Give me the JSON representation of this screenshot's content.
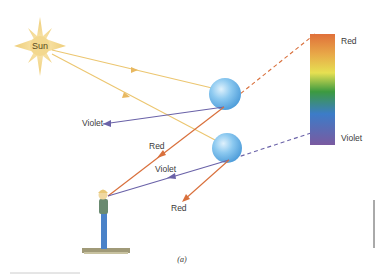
{
  "figure": {
    "caption": "(a)",
    "sun_label": "Sun",
    "spectrum": {
      "top_label": "Red",
      "bottom_label": "Violet",
      "colors": [
        "#e0703a",
        "#e8a848",
        "#e8e050",
        "#3c9a40",
        "#3c7cc8",
        "#7a5aa0"
      ]
    },
    "ray_labels": {
      "violet_upper": "Violet",
      "red_middle": "Red",
      "violet_lower": "Violet",
      "red_lower": "Red"
    },
    "colors": {
      "sunlight": "#ecc670",
      "red_ray": "#d9703c",
      "violet_ray": "#6a62a8",
      "droplet": "#6fb8ea",
      "sun": "#f2d48a"
    }
  }
}
